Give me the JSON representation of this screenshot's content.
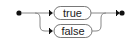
{
  "diagram": {
    "type": "railroad-syntax",
    "choices": [
      {
        "label": "true"
      },
      {
        "label": "false"
      }
    ],
    "colors": {
      "line": "#777777",
      "box_stroke": "#555555",
      "box_fill": "#ffffff",
      "terminal": "#111111"
    }
  }
}
